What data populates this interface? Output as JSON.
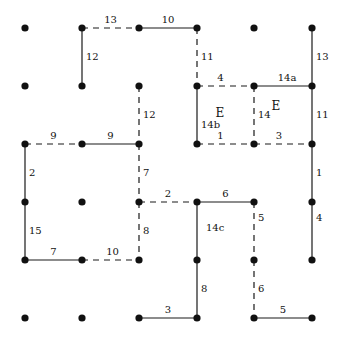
{
  "diagram": {
    "grid": {
      "cols_x": [
        25,
        82,
        139,
        197,
        254,
        312
      ],
      "rows_y": [
        28,
        86,
        144,
        202,
        260,
        318
      ]
    },
    "nodes": [
      [
        0,
        0
      ],
      [
        1,
        0
      ],
      [
        2,
        0
      ],
      [
        3,
        0
      ],
      [
        4,
        0
      ],
      [
        5,
        0
      ],
      [
        0,
        1
      ],
      [
        1,
        1
      ],
      [
        2,
        1
      ],
      [
        3,
        1
      ],
      [
        4,
        1
      ],
      [
        5,
        1
      ],
      [
        0,
        2
      ],
      [
        1,
        2
      ],
      [
        2,
        2
      ],
      [
        3,
        2
      ],
      [
        4,
        2
      ],
      [
        5,
        2
      ],
      [
        0,
        3
      ],
      [
        1,
        3
      ],
      [
        2,
        3
      ],
      [
        3,
        3
      ],
      [
        4,
        3
      ],
      [
        5,
        3
      ],
      [
        0,
        4
      ],
      [
        1,
        4
      ],
      [
        2,
        4
      ],
      [
        3,
        4
      ],
      [
        4,
        4
      ],
      [
        5,
        4
      ],
      [
        0,
        5
      ],
      [
        1,
        5
      ],
      [
        2,
        5
      ],
      [
        3,
        5
      ],
      [
        4,
        5
      ],
      [
        5,
        5
      ]
    ],
    "edges": [
      {
        "from": [
          1,
          0
        ],
        "to": [
          2,
          0
        ],
        "style": "dashed",
        "label": "13",
        "lx": 0,
        "ly": -5
      },
      {
        "from": [
          2,
          0
        ],
        "to": [
          3,
          0
        ],
        "style": "solid",
        "label": "10",
        "lx": 0,
        "ly": -5
      },
      {
        "from": [
          1,
          0
        ],
        "to": [
          1,
          1
        ],
        "style": "solid",
        "label": "12",
        "lx": 9,
        "ly": 3
      },
      {
        "from": [
          3,
          0
        ],
        "to": [
          3,
          1
        ],
        "style": "dashed",
        "label": "11",
        "lx": 9,
        "ly": 3
      },
      {
        "from": [
          5,
          0
        ],
        "to": [
          5,
          1
        ],
        "style": "solid",
        "label": "13",
        "lx": 9,
        "ly": 3
      },
      {
        "from": [
          2,
          1
        ],
        "to": [
          2,
          2
        ],
        "style": "dashed",
        "label": "12",
        "lx": 9,
        "ly": 3
      },
      {
        "from": [
          3,
          1
        ],
        "to": [
          4,
          1
        ],
        "style": "dashed",
        "label": "4",
        "lx": -5,
        "ly": -5
      },
      {
        "from": [
          4,
          1
        ],
        "to": [
          5,
          1
        ],
        "style": "solid",
        "label": "14a",
        "lx": 4,
        "ly": -5
      },
      {
        "from": [
          3,
          1
        ],
        "to": [
          3,
          2
        ],
        "style": "solid",
        "label": "14b",
        "lx": 8,
        "ly": 13
      },
      {
        "from": [
          4,
          1
        ],
        "to": [
          4,
          2
        ],
        "style": "dashed",
        "label": "14",
        "lx": 9,
        "ly": 3
      },
      {
        "from": [
          5,
          1
        ],
        "to": [
          5,
          2
        ],
        "style": "solid",
        "label": "11",
        "lx": 9,
        "ly": 3
      },
      {
        "from": [
          3,
          2
        ],
        "to": [
          4,
          2
        ],
        "style": "dashed",
        "label": "1",
        "lx": -5,
        "ly": -5
      },
      {
        "from": [
          4,
          2
        ],
        "to": [
          5,
          2
        ],
        "style": "dashed",
        "label": "3",
        "lx": -4,
        "ly": -5
      },
      {
        "from": [
          0,
          2
        ],
        "to": [
          1,
          2
        ],
        "style": "dashed",
        "label": "9",
        "lx": 0,
        "ly": -5
      },
      {
        "from": [
          1,
          2
        ],
        "to": [
          2,
          2
        ],
        "style": "solid",
        "label": "9",
        "lx": 0,
        "ly": -5
      },
      {
        "from": [
          0,
          2
        ],
        "to": [
          0,
          3
        ],
        "style": "solid",
        "label": "2",
        "lx": 8,
        "ly": 3
      },
      {
        "from": [
          2,
          2
        ],
        "to": [
          2,
          3
        ],
        "style": "dashed",
        "label": "7",
        "lx": 8,
        "ly": 3
      },
      {
        "from": [
          5,
          2
        ],
        "to": [
          5,
          3
        ],
        "style": "solid",
        "label": "1",
        "lx": 9,
        "ly": 3
      },
      {
        "from": [
          0,
          3
        ],
        "to": [
          0,
          4
        ],
        "style": "solid",
        "label": "15",
        "lx": 9,
        "ly": 3
      },
      {
        "from": [
          2,
          3
        ],
        "to": [
          3,
          3
        ],
        "style": "dashed",
        "label": "2",
        "lx": 0,
        "ly": -5
      },
      {
        "from": [
          2,
          3
        ],
        "to": [
          2,
          4
        ],
        "style": "dashed",
        "label": "8",
        "lx": 8,
        "ly": 3
      },
      {
        "from": [
          3,
          3
        ],
        "to": [
          4,
          3
        ],
        "style": "solid",
        "label": "6",
        "lx": 0,
        "ly": -5
      },
      {
        "from": [
          3,
          3
        ],
        "to": [
          3,
          4
        ],
        "style": "solid",
        "label": "14c",
        "lx": 14,
        "ly": 0
      },
      {
        "from": [
          4,
          3
        ],
        "to": [
          4,
          4
        ],
        "style": "dashed",
        "label": "5",
        "lx": 8,
        "ly": -10
      },
      {
        "from": [
          5,
          3
        ],
        "to": [
          5,
          4
        ],
        "style": "solid",
        "label": "4",
        "lx": 8,
        "ly": -10
      },
      {
        "from": [
          0,
          4
        ],
        "to": [
          1,
          4
        ],
        "style": "solid",
        "label": "7",
        "lx": 0,
        "ly": -5
      },
      {
        "from": [
          1,
          4
        ],
        "to": [
          2,
          4
        ],
        "style": "dashed",
        "label": "10",
        "lx": 2,
        "ly": -5
      },
      {
        "from": [
          3,
          4
        ],
        "to": [
          3,
          5
        ],
        "style": "solid",
        "label": "8",
        "lx": 8,
        "ly": 3
      },
      {
        "from": [
          4,
          4
        ],
        "to": [
          4,
          5
        ],
        "style": "dashed",
        "label": "6",
        "lx": 8,
        "ly": 3
      },
      {
        "from": [
          2,
          5
        ],
        "to": [
          3,
          5
        ],
        "style": "solid",
        "label": "3",
        "lx": 0,
        "ly": -5
      },
      {
        "from": [
          4,
          5
        ],
        "to": [
          5,
          5
        ],
        "style": "solid",
        "label": "5",
        "lx": 0,
        "ly": -5
      }
    ],
    "regions": [
      {
        "label": "E",
        "x": 220,
        "y": 117
      },
      {
        "label": "E",
        "x": 276,
        "y": 110
      }
    ]
  }
}
